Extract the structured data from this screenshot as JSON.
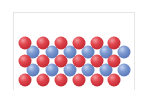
{
  "diagram": {
    "type": "crystal-lattice-layers",
    "colors": {
      "atom_a": "#d9434b",
      "atom_b": "#6f8fc8",
      "border": "#e6e6e6"
    },
    "rows": [
      {
        "kind": "red",
        "y": 43,
        "x": [
          25,
          43,
          61,
          79,
          97,
          114
        ]
      },
      {
        "kind": "blue",
        "y": 52,
        "x": [
          33,
          52,
          70,
          88,
          106,
          124
        ]
      },
      {
        "kind": "red",
        "y": 61,
        "x": [
          25,
          43,
          61,
          79,
          97,
          114
        ]
      },
      {
        "kind": "blue",
        "y": 70,
        "x": [
          33,
          52,
          70,
          88,
          106,
          124
        ]
      },
      {
        "kind": "red",
        "y": 80,
        "x": [
          25,
          43,
          61,
          79,
          97,
          114
        ]
      }
    ]
  }
}
